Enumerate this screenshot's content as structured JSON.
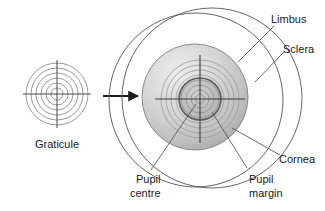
{
  "figure": {
    "background_color": "#ffffff"
  },
  "labels": {
    "graticule": "Graticule",
    "limbus": "Limbus",
    "sclera": "Sclera",
    "cornea": "Cornea",
    "pupil_centre_line1": "Pupil",
    "pupil_centre_line2": "centre",
    "pupil_margin_line1": "Pupil",
    "pupil_margin_line2": "margin"
  },
  "colors": {
    "outline": "#4d4d4d",
    "ring": "#8c8c8c",
    "crosshair": "#404040",
    "iris_light": "#e2e2e2",
    "iris_mid": "#c9c9c9",
    "iris_dark": "#a8a8a8",
    "pupil_fill": "#bdbdbd",
    "pupil_ring": "#595959",
    "leader": "#5a5a5a",
    "arrow": "#1a1a1a",
    "text": "#1a1a1a"
  },
  "graticule_small": {
    "center_x": 57,
    "center_y": 94,
    "ring_radii": [
      6,
      11,
      16,
      21,
      26,
      31
    ],
    "crosshair_half_length": 34
  },
  "eye": {
    "sclera": {
      "cx": 210,
      "cy": 98,
      "r": 90
    },
    "cornea": {
      "cx": 196,
      "cy": 100,
      "r": 88
    },
    "iris": {
      "cx": 195,
      "cy": 97,
      "r": 53
    },
    "pupil": {
      "cx": 200,
      "cy": 99,
      "r": 21
    },
    "graticule_rings": [
      5,
      9,
      14,
      19,
      24,
      29,
      34,
      39
    ],
    "graticule_center_x": 200,
    "graticule_center_y": 99,
    "crosshair_half_length": 45
  },
  "arrow": {
    "x_start": 103,
    "x_end": 141,
    "y": 96
  }
}
